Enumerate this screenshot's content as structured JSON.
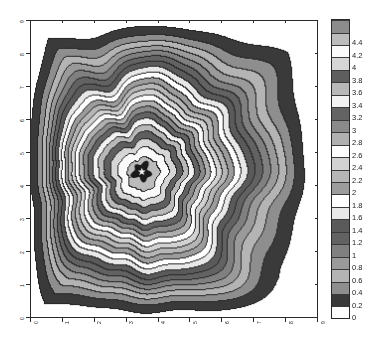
{
  "chart_data": {
    "type": "heatmap",
    "subtype": "filled-contour",
    "title": "",
    "xlabel": "",
    "ylabel": "",
    "xlim": [
      0,
      9
    ],
    "ylim": [
      0,
      9
    ],
    "xticks": [
      "0",
      "1",
      "2",
      "3",
      "4",
      "5",
      "6",
      "7",
      "8",
      "9"
    ],
    "yticks": [
      "0",
      "1",
      "2",
      "3",
      "4",
      "5",
      "6",
      "7",
      "8",
      "9"
    ],
    "grid": false,
    "colormap": "gray-banded",
    "zmin": 0,
    "zmax": 4.6,
    "level_step": 0.2,
    "peak": {
      "x": 3.5,
      "y": 4.4,
      "value": 4.6,
      "marker": "star"
    },
    "colorbar": {
      "position": "right",
      "orientation": "vertical",
      "levels": [
        "0",
        "0.2",
        "0.4",
        "0.6",
        "0.8",
        "1",
        "1.2",
        "1.4",
        "1.6",
        "1.8",
        "2",
        "2.2",
        "2.4",
        "2.6",
        "2.8",
        "3",
        "3.2",
        "3.4",
        "3.6",
        "3.8",
        "4",
        "4.2",
        "4.4"
      ],
      "swatch_colors": [
        "#ffffff",
        "#3a3a3a",
        "#8e8e8e",
        "#b4b4b4",
        "#9a9a9a",
        "#808080",
        "#626262",
        "#5a5a5a",
        "#e8e8e8",
        "#ffffff",
        "#9c9c9c",
        "#b6b6b6",
        "#d2d2d2",
        "#fdfdfd",
        "#b0b0b0",
        "#8a8a8a",
        "#636363",
        "#f2f2f2",
        "#b8b8b8",
        "#5e5e5e",
        "#d6d6d6",
        "#fafafa",
        "#bcbcbc",
        "#8c8c8c"
      ]
    },
    "field_description": "Radially decaying multi-ringed peak centered near (3.5,4.4); gray low-value plateaus occupy the four corners of the domain."
  }
}
